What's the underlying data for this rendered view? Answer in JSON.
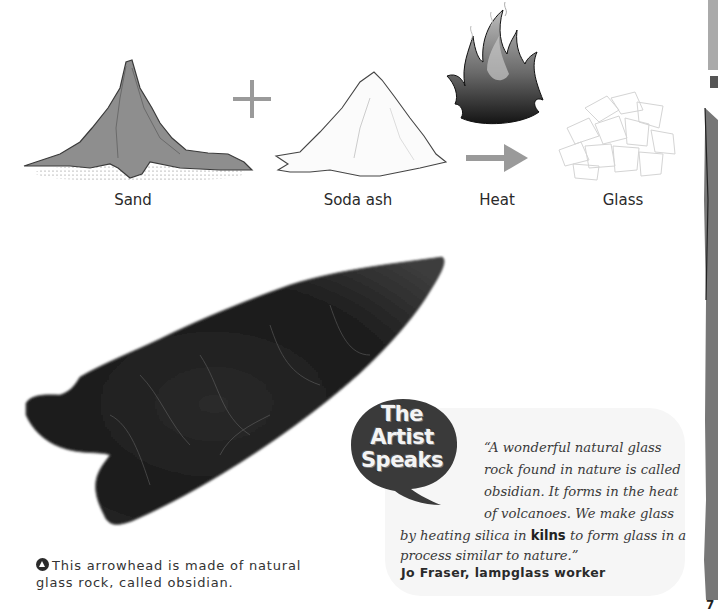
{
  "diagram": {
    "items": [
      {
        "label": "Sand",
        "icon": "sand-pile-icon"
      },
      {
        "label": "Soda ash",
        "icon": "soda-ash-pile-icon"
      },
      {
        "label": "Heat",
        "icon": "flame-icon"
      },
      {
        "label": "Glass",
        "icon": "glass-shards-icon"
      }
    ],
    "operator_plus": "+",
    "operator_arrow": "→"
  },
  "photo": {
    "subject": "obsidian arrowhead"
  },
  "caption": {
    "icon": "triangle-up-circle-icon",
    "text": "This arrowhead is made of natural glass rock, called obsidian."
  },
  "artist_speaks": {
    "badge_lines": [
      "The",
      "Artist",
      "Speaks"
    ],
    "quote_lines": [
      "“A wonderful natural glass",
      "rock found in nature is called",
      "obsidian. It forms in the heat",
      "of volcanoes. We make glass"
    ],
    "quote_line5_before": "by heating silica in ",
    "quote_keyword": "kilns",
    "quote_line5_after": " to form glass in a",
    "quote_line6": "process similar to nature.”",
    "author": "Jo Fraser, lampglass worker"
  },
  "page": {
    "number_fragment": "7"
  },
  "colors": {
    "sand": "#8e8e8e",
    "panel_bg": "#f6f6f6",
    "bubble": "#3a3a3a",
    "arrow": "#9a9a9a"
  }
}
